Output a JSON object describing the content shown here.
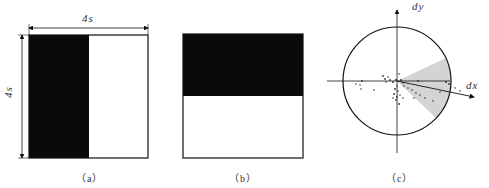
{
  "panels": [
    {
      "id": "a",
      "caption": "（a）",
      "dim_top": "4s",
      "dim_left": "4s",
      "fill": "left-half-black"
    },
    {
      "id": "b",
      "caption": "（b）",
      "fill": "top-half-black"
    },
    {
      "id": "c",
      "caption": "（c）",
      "axis_x_label": "dx",
      "axis_y_label": "dy",
      "description": "unit circle with scatter of displacement vectors, shaded wedge around dominant direction"
    }
  ],
  "colors": {
    "ink": "#111111",
    "wedge": "#d4d4d4",
    "background": "#ffffff"
  }
}
